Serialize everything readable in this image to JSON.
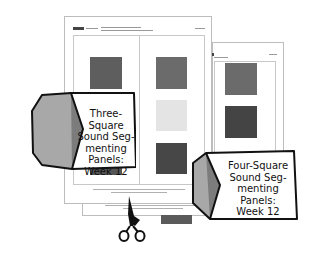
{
  "labels": {
    "three_square": {
      "line1": "Three-Square",
      "line2": "Sound Seg-",
      "line3": "menting Panels:",
      "line4": "Week 12"
    },
    "four_square": {
      "line1": "Four-Square",
      "line2": "Sound Seg-",
      "line3": "menting Panels:",
      "line4": "Week 12"
    }
  },
  "colors": {
    "square_dark": "#4a4a4a",
    "square_mid": "#6b6b6b",
    "square_light": "#e4e4e4",
    "label_fold_light": "#a8a8a8",
    "label_fold_dark": "#7a7a7a",
    "outline": "#111111"
  },
  "icons": {
    "scissors": "scissors-icon"
  }
}
